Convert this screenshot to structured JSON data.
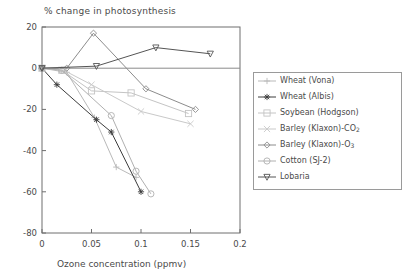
{
  "chart_data": {
    "type": "line",
    "title": "% change in photosynthesis",
    "xlabel": "Ozone concentration (ppmv)",
    "ylabel": "",
    "xlim": [
      0,
      0.2
    ],
    "ylim": [
      -80,
      20
    ],
    "xticks": [
      "0",
      "0.05",
      "0.1",
      "0.15",
      "0.2"
    ],
    "xtick_values": [
      0,
      0.05,
      0.1,
      0.15,
      0.2
    ],
    "yticks": [
      "20",
      "0",
      "-20",
      "-40",
      "-60",
      "-80"
    ],
    "ytick_values": [
      20,
      0,
      -20,
      -40,
      -60,
      -80
    ],
    "grid": false,
    "legend_position": "right-outside",
    "zero_line": true,
    "series": [
      {
        "name": "Wheat (Vona)",
        "marker": "plus",
        "color": "#b9b9b9",
        "points": [
          [
            0.0,
            0
          ],
          [
            0.025,
            -2
          ],
          [
            0.053,
            -24
          ],
          [
            0.075,
            -48
          ],
          [
            0.095,
            -53
          ]
        ]
      },
      {
        "name": "Wheat (Albis)",
        "marker": "asterisk",
        "color": "#3c3c3c",
        "points": [
          [
            0.0,
            0
          ],
          [
            0.015,
            -8
          ],
          [
            0.055,
            -25
          ],
          [
            0.07,
            -31
          ],
          [
            0.1,
            -60
          ]
        ]
      },
      {
        "name": "Soybean (Hodgson)",
        "marker": "square",
        "color": "#c4c4c4",
        "points": [
          [
            0.0,
            0
          ],
          [
            0.02,
            -1
          ],
          [
            0.05,
            -11
          ],
          [
            0.09,
            -12
          ],
          [
            0.148,
            -22
          ]
        ]
      },
      {
        "name": "Barley (Klaxon)-CO2",
        "marker": "x",
        "color": "#c9c9c9",
        "points": [
          [
            0.0,
            0
          ],
          [
            0.022,
            -1
          ],
          [
            0.05,
            -8
          ],
          [
            0.1,
            -21
          ],
          [
            0.15,
            -27
          ]
        ]
      },
      {
        "name": "Barley (Klaxon)-O3",
        "marker": "diamond",
        "color": "#8c8c8c",
        "points": [
          [
            0.0,
            0
          ],
          [
            0.025,
            0
          ],
          [
            0.052,
            17
          ],
          [
            0.105,
            -10
          ],
          [
            0.155,
            -20
          ]
        ]
      },
      {
        "name": "Cotton (SJ-2)",
        "marker": "circle",
        "color": "#b0b0b0",
        "points": [
          [
            0.0,
            0
          ],
          [
            0.02,
            -1
          ],
          [
            0.07,
            -23
          ],
          [
            0.095,
            -50
          ],
          [
            0.11,
            -61
          ]
        ]
      },
      {
        "name": "Lobaria",
        "marker": "triangle-down",
        "color": "#555555",
        "points": [
          [
            0.0,
            0
          ],
          [
            0.055,
            1
          ],
          [
            0.115,
            10
          ],
          [
            0.17,
            7
          ]
        ]
      }
    ]
  },
  "legend": {
    "entries": [
      {
        "label": "Wheat (Vona)",
        "sub": "",
        "tail": ""
      },
      {
        "label": "Wheat (Albis)",
        "sub": "",
        "tail": ""
      },
      {
        "label": "Soybean (Hodgson)",
        "sub": "",
        "tail": ""
      },
      {
        "label": "Barley (Klaxon)-CO",
        "sub": "2",
        "tail": ""
      },
      {
        "label": "Barley (Klaxon)-O",
        "sub": "3",
        "tail": ""
      },
      {
        "label": "Cotton (SJ-2)",
        "sub": "",
        "tail": ""
      },
      {
        "label": "Lobaria",
        "sub": "",
        "tail": ""
      }
    ]
  },
  "colors": {
    "axis": "#6e6e6e",
    "text": "#4a4a4a",
    "background": "#ffffff"
  }
}
